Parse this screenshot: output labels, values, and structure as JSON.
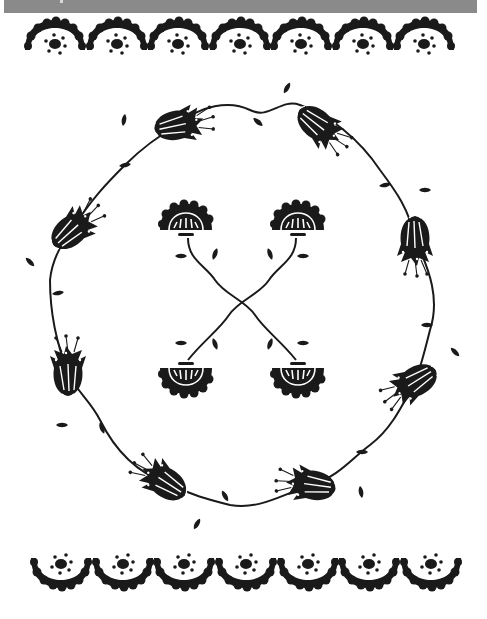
{
  "artwork": {
    "style": "folk-art stencil illustration",
    "ink_color": "#1a1a1a",
    "paper_color": "#ffffff",
    "header_bar_color": "#8a8a8a"
  },
  "top_border": {
    "motif": "scalloped-half-flower",
    "count": 7,
    "orientation": "dome-up",
    "y": 42,
    "x_positions": [
      55,
      117,
      178,
      240,
      301,
      363,
      424
    ]
  },
  "bottom_border": {
    "motif": "scalloped-half-flower",
    "count": 7,
    "orientation": "bowl-down",
    "y": 566,
    "x_positions": [
      61,
      123,
      184,
      246,
      308,
      369,
      431
    ]
  },
  "wreath": {
    "motif": "vine-with-bell-flowers",
    "bell_flowers": 8,
    "center": [
      240,
      300
    ],
    "flowers": [
      {
        "name": "bell-flower-top-left",
        "x": 178,
        "y": 125,
        "rot": -100
      },
      {
        "name": "bell-flower-top-right",
        "x": 318,
        "y": 125,
        "rot": -30
      },
      {
        "name": "bell-flower-right-upper",
        "x": 415,
        "y": 240,
        "rot": 0
      },
      {
        "name": "bell-flower-right-lower",
        "x": 415,
        "y": 382,
        "rot": 50
      },
      {
        "name": "bell-flower-bottom-right",
        "x": 312,
        "y": 485,
        "rot": 100
      },
      {
        "name": "bell-flower-bottom-left",
        "x": 165,
        "y": 482,
        "rot": 150
      },
      {
        "name": "bell-flower-left-lower",
        "x": 68,
        "y": 372,
        "rot": 180
      },
      {
        "name": "bell-flower-left-upper",
        "x": 72,
        "y": 230,
        "rot": 210
      }
    ]
  },
  "center_motif": {
    "motif": "crossed-stems-with-fan-flowers",
    "fan_flowers": 4
  }
}
